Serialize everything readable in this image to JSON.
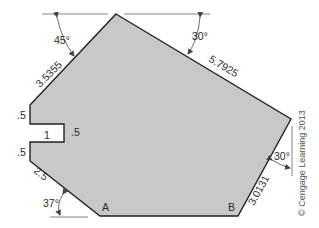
{
  "figure": {
    "fill_color": "#c8c8c8",
    "stroke_color": "#222222",
    "dimension_line_color": "#555555",
    "vertices": [
      [
        116,
        14
      ],
      [
        291,
        119
      ],
      [
        238,
        216
      ],
      [
        100,
        216
      ],
      [
        30,
        161
      ],
      [
        30,
        142
      ],
      [
        64,
        142
      ],
      [
        64,
        124
      ],
      [
        30,
        124
      ],
      [
        30,
        105
      ]
    ]
  },
  "labels": {
    "angle_top_left": "45°",
    "angle_top_right": "30°",
    "angle_right": "30°",
    "angle_bottom_left": "37°",
    "edge_upper_left": "3.5355",
    "edge_upper_right": "5.7925",
    "edge_lower_right": "3.0131",
    "edge_lower_left": "2.5",
    "left_upper": ".5",
    "left_lower": ".5",
    "notch_width": "1",
    "notch_height": ".5",
    "point_a": "A",
    "point_b": "B",
    "copyright": "© Cengage Learning 2013"
  }
}
